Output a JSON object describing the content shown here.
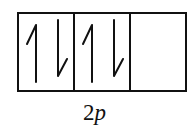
{
  "diagram": {
    "subshell_label": {
      "number": "2",
      "letter": "p"
    },
    "orbitals": [
      {
        "index": 1,
        "electrons": [
          "up",
          "down"
        ]
      },
      {
        "index": 2,
        "electrons": [
          "up",
          "down"
        ]
      },
      {
        "index": 3,
        "electrons": []
      }
    ],
    "total_electrons": 4,
    "colors": {
      "line": "#111111",
      "background": "#ffffff"
    }
  }
}
